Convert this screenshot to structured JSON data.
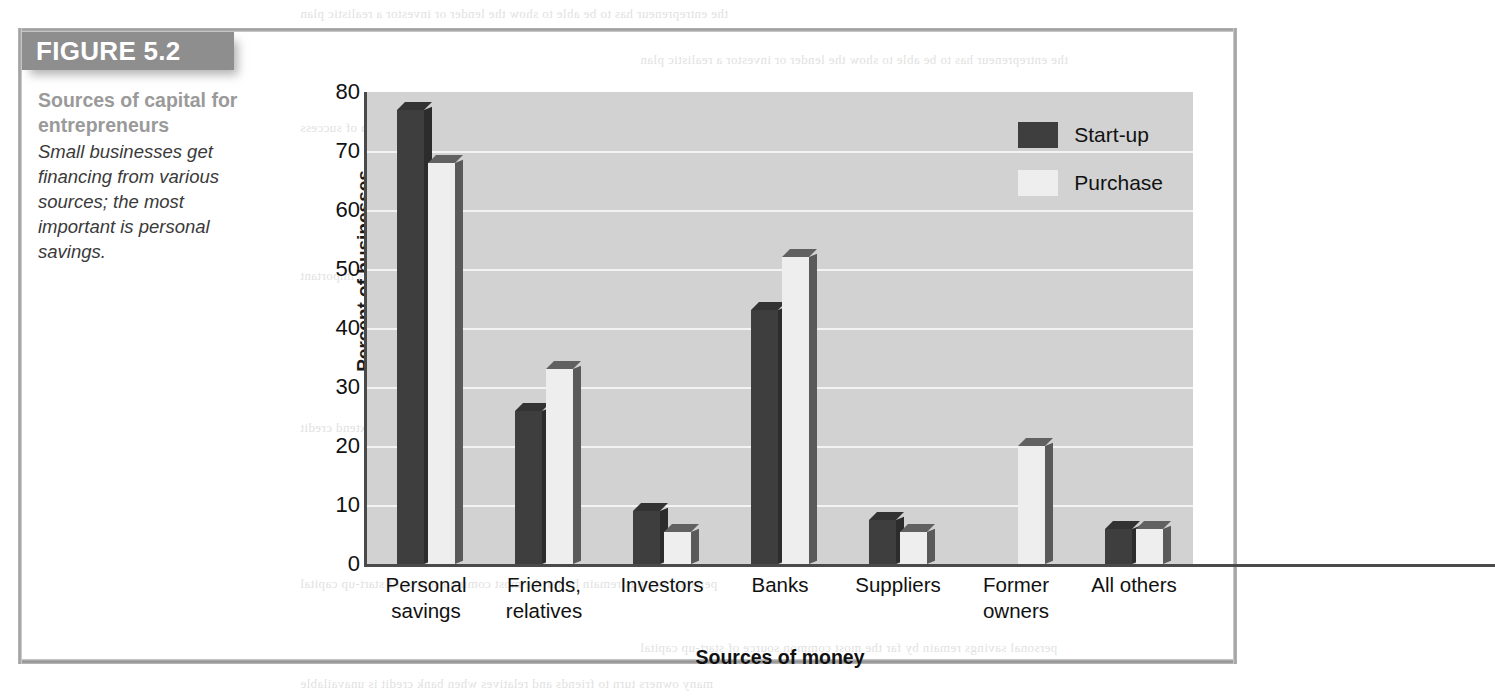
{
  "figure": {
    "tag_label": "FIGURE 5.2",
    "caption_title": "Sources of capital for entrepreneurs",
    "caption_body": "Small businesses get financing from various sources; the most important is personal savings."
  },
  "colors": {
    "tag_background": "#8e8e8e",
    "caption_title": "#9a9a9a",
    "plot_background": "#d2d2d2",
    "gridline": "#f3f3f3",
    "series_start_up": "#3e3e3e",
    "series_purchase": "#eeeeee",
    "axis": "#4a4a4a"
  },
  "chart_data": {
    "type": "bar",
    "title": "Sources of capital for entrepreneurs",
    "xlabel": "Sources of money",
    "ylabel": "Percent of businesses",
    "ylim": [
      0,
      80
    ],
    "yticks": [
      0,
      10,
      20,
      30,
      40,
      50,
      60,
      70,
      80
    ],
    "grid": true,
    "legend_position": "top-right",
    "categories": [
      "Personal savings",
      "Friends, relatives",
      "Investors",
      "Banks",
      "Suppliers",
      "Former owners",
      "All others"
    ],
    "category_lines": [
      [
        "Personal",
        "savings"
      ],
      [
        "Friends,",
        "relatives"
      ],
      [
        "Investors",
        ""
      ],
      [
        "Banks",
        ""
      ],
      [
        "Suppliers",
        ""
      ],
      [
        "Former",
        "owners"
      ],
      [
        "All others",
        ""
      ]
    ],
    "series": [
      {
        "name": "Start-up",
        "values": [
          77,
          26,
          9,
          43,
          7.5,
          0,
          6
        ]
      },
      {
        "name": "Purchase",
        "values": [
          68,
          33,
          5.5,
          52,
          5.5,
          20,
          6
        ]
      }
    ]
  },
  "bleed_text": {
    "lines": [
      "the entrepreneur has to be able to show the lender or investor a realistic plan",
      "for repaying the borrowed money and a reasonable expectation of success",
      "to the business a healthy mix of debt and equity financing is important",
      "the cost of borrowing and the willingness of lenders to extend credit",
      "personal savings remain by far the most common source of start-up capital",
      "many owners turn to friends and relatives when bank credit is unavailable",
      "suppliers may offer trade credit which functions as short-term financing",
      "former owners often finance part of the purchase price of a business"
    ]
  }
}
